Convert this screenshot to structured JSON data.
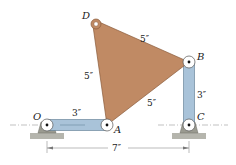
{
  "diagram": {
    "colors": {
      "plate": "#c08a64",
      "plate_edge": "#8a5a3a",
      "link": "#a9c3d9",
      "link_edge": "#5a7890",
      "support": "#9a9a90",
      "ground": "#b5b5ad",
      "pin_fill": "#ffffff",
      "line": "#555555"
    },
    "points": {
      "O": {
        "label": "O",
        "x": 47,
        "y": 125
      },
      "A": {
        "label": "A",
        "x": 107,
        "y": 125
      },
      "B": {
        "label": "B",
        "x": 189,
        "y": 62
      },
      "C": {
        "label": "C",
        "x": 189,
        "y": 125
      },
      "D": {
        "label": "D",
        "x": 96,
        "y": 24
      }
    },
    "dimensions": {
      "DB": "5″",
      "DA": "5″",
      "AB": "5″",
      "OA": "3″",
      "BC": "3″",
      "OC": "7″"
    }
  }
}
